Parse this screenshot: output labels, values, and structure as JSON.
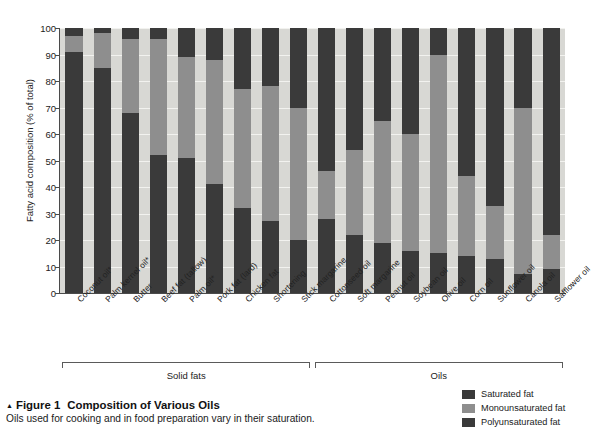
{
  "chart_data": {
    "type": "bar",
    "subtype": "stacked-percent",
    "title": "Composition of Various Oils",
    "xlabel": "",
    "ylabel": "Fatty acid composition (% of total)",
    "ylim": [
      0,
      100
    ],
    "yticks": [
      0,
      10,
      20,
      30,
      40,
      50,
      60,
      70,
      80,
      90,
      100
    ],
    "grid": true,
    "legend_position": "bottom-right",
    "categories": [
      "Coconut oil*",
      "Palm kernel oil*",
      "Butter",
      "Beef fat (tallow)",
      "Palm oil*",
      "Pork fat (lard)",
      "Chicken fat",
      "Shortening",
      "Stick margarine",
      "Cottonseed oil",
      "Soft margarine",
      "Peanut oil",
      "Soybean oil",
      "Olive oil",
      "Corn oil",
      "Sunflower oil",
      "Canola oil",
      "Safflower oil"
    ],
    "series": [
      {
        "name": "Saturated fat",
        "color": "#3a3a3a",
        "values": [
          91,
          85,
          68,
          52,
          51,
          41,
          32,
          27,
          20,
          28,
          22,
          19,
          16,
          15,
          14,
          13,
          7,
          9
        ]
      },
      {
        "name": "Monounsaturated fat",
        "color": "#8e8e8e",
        "values": [
          6,
          13,
          28,
          44,
          38,
          47,
          45,
          51,
          50,
          18,
          32,
          46,
          44,
          75,
          30,
          20,
          63,
          13
        ]
      },
      {
        "name": "Polyunsaturated fat",
        "color": "#3a3a3a",
        "values": [
          3,
          2,
          4,
          4,
          11,
          12,
          23,
          22,
          30,
          54,
          46,
          35,
          40,
          10,
          56,
          67,
          30,
          78
        ]
      }
    ],
    "groups": [
      {
        "label": "Solid fats",
        "start": 0,
        "end": 8
      },
      {
        "label": "Oils",
        "start": 9,
        "end": 17
      }
    ]
  },
  "legend": {
    "items": [
      {
        "label": "Saturated fat",
        "color": "#3a3a3a"
      },
      {
        "label": "Monounsaturated fat",
        "color": "#8e8e8e"
      },
      {
        "label": "Polyunsaturated fat",
        "color": "#3a3a3a"
      }
    ]
  },
  "caption": {
    "marker": "▲",
    "figure_number": "Figure 1",
    "title": "Composition of Various Oils",
    "description": "Oils used for cooking and in food preparation vary in their saturation."
  }
}
